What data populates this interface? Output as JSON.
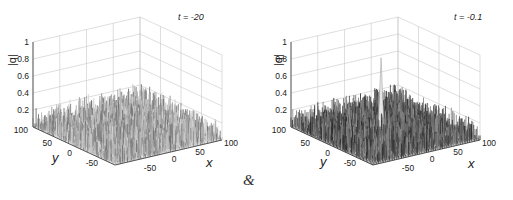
{
  "chart_data": [
    {
      "type": "surface3d",
      "title": "t = -20",
      "xlabel": "x",
      "ylabel": "y",
      "zlabel": "|q|",
      "x_ticks": [
        "-50",
        "0",
        "50",
        "100"
      ],
      "y_ticks": [
        "100",
        "50",
        "0",
        "-50"
      ],
      "z_ticks": [
        "0.2",
        "0.4",
        "0.6",
        "0.8",
        "1"
      ],
      "xlim": [
        -100,
        100
      ],
      "ylim": [
        -100,
        100
      ],
      "zlim": [
        0,
        1
      ],
      "grid": true,
      "description": "Random low-amplitude noise field, |q| roughly 0 to 0.2, no localized peak",
      "peak_value": 0.2,
      "shading": "light"
    },
    {
      "type": "surface3d",
      "title": "t = -0.1",
      "xlabel": "x",
      "ylabel": "y",
      "zlabel": "|q|",
      "x_ticks": [
        "-50",
        "0",
        "50",
        "100"
      ],
      "y_ticks": [
        "100",
        "50",
        "0",
        "-50"
      ],
      "z_ticks": [
        "0.2",
        "0.4",
        "0.6",
        "0.8",
        "1"
      ],
      "xlim": [
        -100,
        100
      ],
      "ylim": [
        -100,
        100
      ],
      "zlim": [
        0,
        1
      ],
      "grid": true,
      "description": "Noise background |q| ~0 to 0.25 with a single sharp localized peak near the center reaching about 0.85",
      "peak_value": 0.85,
      "shading": "dark"
    }
  ],
  "panels": [
    {
      "title": "t = -20",
      "zlabel": "|q|",
      "xlabel": "x",
      "ylabel": "y",
      "z_ticks": [
        "1",
        "0.8",
        "0.6",
        "0.4",
        "0.2"
      ],
      "y_ticks": [
        "100",
        "50",
        "0",
        "-50"
      ],
      "x_ticks": [
        "-50",
        "0",
        "50",
        "100"
      ]
    },
    {
      "title": "t = -0.1",
      "zlabel": "|q|",
      "xlabel": "x",
      "ylabel": "y",
      "z_ticks": [
        "1",
        "0.8",
        "0.6",
        "0.4",
        "0.2"
      ],
      "y_ticks": [
        "100",
        "50",
        "0",
        "-50"
      ],
      "x_ticks": [
        "-50",
        "0",
        "50",
        "100"
      ]
    }
  ],
  "separator": "&"
}
